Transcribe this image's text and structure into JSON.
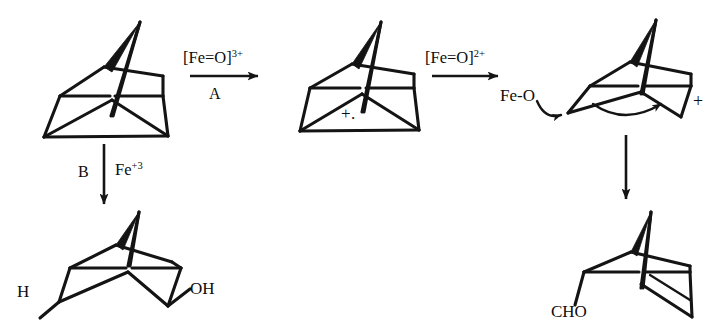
{
  "scheme": {
    "title": "Quadricyclane oxidation mechanism scheme",
    "background_color": "#ffffff",
    "line_color": "#141414"
  },
  "reagents": {
    "step1": {
      "above_text": "[Fe=O]",
      "above_charge": "3+",
      "below_text": "A"
    },
    "step2": {
      "above_text": "[Fe=O]",
      "above_charge": "2+",
      "below_text": ""
    },
    "step_b": {
      "left_text": "B",
      "right_text": "Fe",
      "right_charge": "+3"
    },
    "step_down_right": {
      "label": ""
    }
  },
  "structures": {
    "start": {
      "name": "quadricyclane",
      "label": ""
    },
    "radical_cation": {
      "name": "quadricyclane-radical-cation",
      "charge_label": "+."
    },
    "iron_oxo_adduct": {
      "name": "fe-oxo-carbocation-adduct",
      "fe_label": "Fe-O",
      "charge_label": "+"
    },
    "product_diol": {
      "name": "norbornane-h-oh-product",
      "left_label": "H",
      "right_label": "OH"
    },
    "product_aldehyde": {
      "name": "norbornene-cho-product",
      "label": "CHO"
    }
  }
}
